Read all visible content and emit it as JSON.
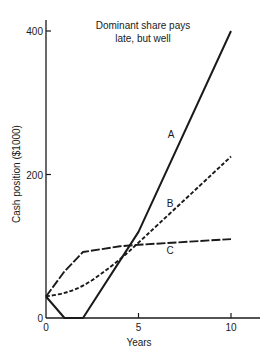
{
  "chart_data": {
    "type": "line",
    "title": "Dominant share pays late, but well",
    "title_lines": [
      "Dominant share pays",
      "late, but well"
    ],
    "xlabel": "Years",
    "ylabel": "Cash position ($1000)",
    "xlim": [
      0,
      11.5
    ],
    "ylim": [
      0,
      420
    ],
    "x_ticks": [
      0,
      5,
      10
    ],
    "y_ticks": [
      0,
      200,
      400
    ],
    "x_tick_labels": [
      "0",
      "5",
      "10"
    ],
    "y_tick_labels": [
      "0",
      "200",
      "400"
    ],
    "grid": false,
    "legend": "inline labels",
    "series": [
      {
        "name": "A",
        "style": "solid",
        "x": [
          0,
          1,
          2,
          4,
          5,
          10
        ],
        "values": [
          30,
          0,
          0,
          80,
          120,
          400
        ]
      },
      {
        "name": "B",
        "style": "short-dash",
        "x": [
          0,
          1,
          2,
          3,
          4,
          5,
          10
        ],
        "values": [
          30,
          35,
          45,
          62,
          82,
          105,
          225
        ]
      },
      {
        "name": "C",
        "style": "long-dash",
        "x": [
          0,
          1,
          2,
          4,
          5,
          10
        ],
        "values": [
          30,
          65,
          92,
          100,
          102,
          110
        ]
      }
    ]
  }
}
